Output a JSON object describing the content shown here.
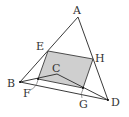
{
  "diagram": {
    "title": "",
    "colors": {
      "line": "#3a3a3a",
      "shade": "#cfcfcf",
      "label": "#333333",
      "background": "#ffffff"
    },
    "points": {
      "A": {
        "label": "A",
        "x": 78,
        "y": 17,
        "lx": 77,
        "ly": 11
      },
      "B": {
        "label": "B",
        "x": 20,
        "y": 82,
        "lx": 11,
        "ly": 86
      },
      "C": {
        "label": "C",
        "x": 57,
        "y": 74,
        "lx": 56,
        "ly": 70
      },
      "D": {
        "label": "D",
        "x": 108,
        "y": 100,
        "lx": 116,
        "ly": 105
      },
      "E": {
        "label": "E",
        "x": 48,
        "y": 51,
        "lx": 40,
        "ly": 49
      },
      "F": {
        "label": "F",
        "x": 38,
        "y": 79,
        "lx": 27,
        "ly": 96
      },
      "G": {
        "label": "G",
        "x": 83,
        "y": 88,
        "lx": 84,
        "ly": 107
      },
      "H": {
        "label": "H",
        "x": 93,
        "y": 59,
        "lx": 100,
        "ly": 61
      }
    },
    "shaded_region": [
      "E",
      "H",
      "G",
      "F"
    ],
    "segments": [
      [
        "A",
        "B"
      ],
      [
        "A",
        "D"
      ],
      [
        "B",
        "D"
      ],
      [
        "B",
        "C"
      ],
      [
        "C",
        "D"
      ],
      [
        "E",
        "H"
      ],
      [
        "H",
        "G"
      ],
      [
        "E",
        "F"
      ],
      [
        "F",
        "G"
      ]
    ]
  }
}
